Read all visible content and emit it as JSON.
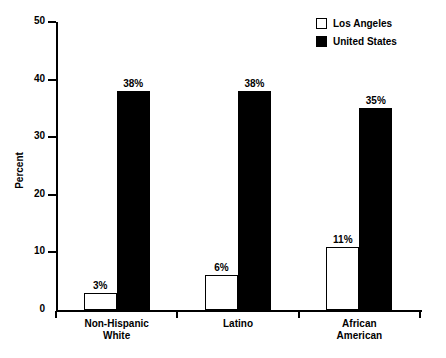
{
  "chart_data": {
    "type": "bar",
    "title": "",
    "xlabel": "",
    "ylabel": "Percent",
    "ylim": [
      0,
      50
    ],
    "yticks": [
      0,
      10,
      20,
      30,
      40,
      50
    ],
    "ytick_labels": [
      "0",
      "10",
      "20",
      "30",
      "40",
      "50"
    ],
    "grid": false,
    "legend_position": "top-right",
    "categories": [
      "Non-Hispanic\nWhite",
      "Latino",
      "African\nAmerican"
    ],
    "series": [
      {
        "name": "Los Angeles",
        "swatch": "hollow",
        "color": "#ffffff",
        "values": [
          3,
          6,
          11
        ],
        "data_labels": [
          "3%",
          "6%",
          "11%"
        ]
      },
      {
        "name": "United States",
        "swatch": "filled",
        "color": "#000000",
        "values": [
          38,
          38,
          35
        ],
        "data_labels": [
          "38%",
          "38%",
          "35%"
        ]
      }
    ]
  },
  "legend": {
    "items": [
      {
        "label": "Los Angeles"
      },
      {
        "label": "United States"
      }
    ]
  },
  "axes": {
    "y_title": "Percent"
  }
}
